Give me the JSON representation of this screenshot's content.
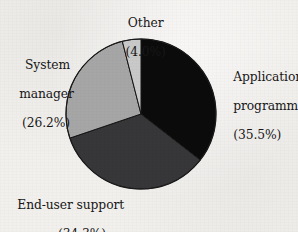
{
  "background_color": "#f2f0ed",
  "chart_data": {
    "type": "pie",
    "title": "",
    "subtitle": "",
    "xlabel": "",
    "ylabel": "",
    "legend_position": "none",
    "labels_position": "outside-callout",
    "grid": false,
    "start_angle_deg": 0,
    "direction": "clockwise",
    "total_percent": 100.0,
    "categories": [
      "Application programmer",
      "End-user support",
      "System manager",
      "Other"
    ],
    "values": [
      35.5,
      34.3,
      26.2,
      4.0
    ],
    "units": "percent",
    "colors": [
      "#0b0b0b",
      "#373739",
      "#a6a6a6",
      "#c9c9c9"
    ],
    "slices": [
      {
        "name": "Application programmer",
        "value": 35.5,
        "value_text": "(35.5%)",
        "color": "#0b0b0b",
        "start_deg": 0.0,
        "end_deg": 127.8,
        "label_lines": [
          "Application",
          "programmer",
          "(35.5%)"
        ],
        "label_anchor": "left"
      },
      {
        "name": "End-user support",
        "value": 34.3,
        "value_text": "(34.3%)",
        "color": "#373739",
        "start_deg": 127.8,
        "end_deg": 251.28,
        "label_lines": [
          "End-user support",
          "(34.3%)"
        ],
        "label_anchor": "left"
      },
      {
        "name": "System manager",
        "value": 26.2,
        "value_text": "(26.2%)",
        "color": "#a6a6a6",
        "start_deg": 251.28,
        "end_deg": 345.6,
        "label_lines": [
          "System",
          "manager",
          "(26.2%)"
        ],
        "label_anchor": "right"
      },
      {
        "name": "Other",
        "value": 4.0,
        "value_text": "(4.0%)",
        "color": "#c9c9c9",
        "start_deg": 345.6,
        "end_deg": 360.0,
        "label_lines": [
          "Other",
          "(4.0%)"
        ],
        "label_anchor": "center"
      }
    ]
  },
  "labels": {
    "other": {
      "line1": "Other",
      "line2": "(4.0%)"
    },
    "application_programmer": {
      "line1": "Application",
      "line2": "programmer",
      "line3": "(35.5%)"
    },
    "system_manager": {
      "line1": "System",
      "line2": "manager",
      "line3": "(26.2%)"
    },
    "end_user_support": {
      "line1": "End-user support",
      "line2": "(34.3%)"
    }
  },
  "geometry": {
    "center_x": 141,
    "center_y": 114,
    "radius": 75
  }
}
